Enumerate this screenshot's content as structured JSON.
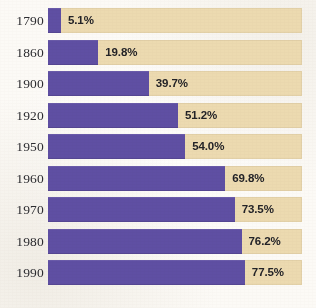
{
  "chart_data": {
    "type": "bar",
    "orientation": "horizontal",
    "title": "",
    "subtitle": "",
    "xlabel": "",
    "ylabel": "",
    "categories": [
      "1790",
      "1860",
      "1900",
      "1920",
      "1950",
      "1960",
      "1970",
      "1980",
      "1990"
    ],
    "values": [
      5.1,
      19.8,
      39.7,
      51.2,
      54.0,
      69.8,
      73.5,
      76.2,
      77.5
    ],
    "value_labels": [
      "5.1%",
      "19.8%",
      "39.7%",
      "51.2%",
      "54.0%",
      "69.8%",
      "73.5%",
      "76.2%",
      "77.5%"
    ],
    "xlim": [
      0,
      100
    ],
    "grid": false,
    "legend": null,
    "series": [
      {
        "name": "",
        "values": [
          5.1,
          19.8,
          39.7,
          51.2,
          54.0,
          69.8,
          73.5,
          76.2,
          77.5
        ]
      }
    ],
    "colors": {
      "bar_fill": "#5f4fa3",
      "track_remainder": "#ecdab0",
      "background": "#fcfaf6",
      "year_text": "#2c2c30",
      "value_text": "#232327"
    }
  },
  "rows": [
    {
      "year": "1790",
      "value": 5.1,
      "label": "5.1%"
    },
    {
      "year": "1860",
      "value": 19.8,
      "label": "19.8%"
    },
    {
      "year": "1900",
      "value": 39.7,
      "label": "39.7%"
    },
    {
      "year": "1920",
      "value": 51.2,
      "label": "51.2%"
    },
    {
      "year": "1950",
      "value": 54.0,
      "label": "54.0%"
    },
    {
      "year": "1960",
      "value": 69.8,
      "label": "69.8%"
    },
    {
      "year": "1970",
      "value": 73.5,
      "label": "73.5%"
    },
    {
      "year": "1980",
      "value": 76.2,
      "label": "76.2%"
    },
    {
      "year": "1990",
      "value": 77.5,
      "label": "77.5%"
    }
  ],
  "layout": {
    "track_left_px": 48,
    "track_width_px": 254,
    "row_height_px": 25,
    "row_pitch_px": 31.5,
    "first_row_top_px": 8,
    "label_gap_px": 7
  }
}
